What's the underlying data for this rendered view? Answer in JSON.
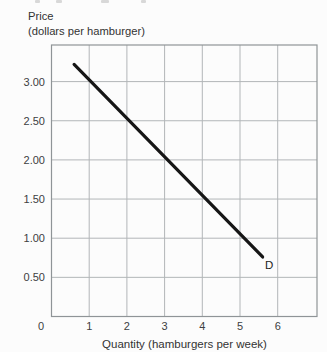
{
  "chart_data": {
    "type": "line",
    "title": "",
    "y_axis_label_line1": "Price",
    "y_axis_label_line2": "(dollars per hamburger)",
    "x_axis_label": "Quantity (hamburgers per week)",
    "x_ticks": [
      "0",
      "1",
      "2",
      "3",
      "4",
      "5",
      "6"
    ],
    "x_tick_values": [
      0,
      1,
      2,
      3,
      4,
      5,
      6
    ],
    "y_ticks": [
      "3.00",
      "2.50",
      "2.00",
      "1.50",
      "1.00",
      "0.50"
    ],
    "y_tick_values": [
      3.0,
      2.5,
      2.0,
      1.5,
      1.0,
      0.5
    ],
    "xlim": [
      0,
      7
    ],
    "ylim": [
      0,
      3.5
    ],
    "grid": true,
    "legend_position": "none",
    "series": [
      {
        "name": "Demand curve",
        "label": "D",
        "points": [
          [
            0.6,
            3.22
          ],
          [
            5.6,
            0.76
          ]
        ],
        "color": "#161616",
        "width": 3.2
      }
    ],
    "colors": {
      "grid": "#b2b6b8",
      "border": "#8f9497",
      "tick_text": "#3d4042",
      "axis_label_text": "#333333",
      "background": "#fcfcfc"
    }
  }
}
